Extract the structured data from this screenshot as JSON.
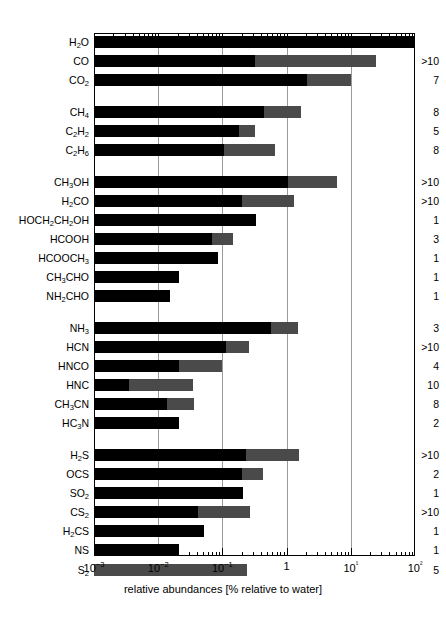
{
  "chart_data": {
    "type": "bar",
    "title": "",
    "xlabel": "relative abundances [% relative to water]",
    "ylabel": "",
    "xscale": "log",
    "xlim": [
      0.001,
      100
    ],
    "xticks": [
      0.001,
      0.01,
      0.1,
      1,
      10,
      100
    ],
    "xticklabels": [
      "10−3",
      "10−2",
      "10−1",
      "1",
      "10¹",
      "10²"
    ],
    "grid": true,
    "legend": null,
    "orientation": "horizontal",
    "series": [
      {
        "name": "lower range",
        "color": "#000000"
      },
      {
        "name": "upper range",
        "color": "#4a4a4a"
      }
    ],
    "annotation_header": "number of comets",
    "groups": [
      {
        "name": "water and oxides",
        "rows": [
          {
            "label": "H2O",
            "label_html": "H<sub>2</sub>O",
            "low": 0.001,
            "mid": 100.0,
            "high": 100.0,
            "comets": ""
          },
          {
            "label": "CO",
            "label_html": "CO",
            "low": 0.001,
            "mid": 0.32,
            "high": 25.0,
            "comets": ">10"
          },
          {
            "label": "CO2",
            "label_html": "CO<sub>2</sub>",
            "low": 0.001,
            "mid": 2.1,
            "high": 10.0,
            "comets": "7"
          }
        ]
      },
      {
        "name": "hydrocarbons",
        "rows": [
          {
            "label": "CH4",
            "label_html": "CH<sub>4</sub>",
            "low": 0.001,
            "mid": 0.45,
            "high": 1.7,
            "comets": "8"
          },
          {
            "label": "C2H2",
            "label_html": "C<sub>2</sub>H<sub>2</sub>",
            "low": 0.001,
            "mid": 0.18,
            "high": 0.32,
            "comets": "5"
          },
          {
            "label": "C2H6",
            "label_html": "C<sub>2</sub>H<sub>6</sub>",
            "low": 0.001,
            "mid": 0.105,
            "high": 0.65,
            "comets": "8"
          }
        ]
      },
      {
        "name": "oxygenated organics",
        "rows": [
          {
            "label": "CH3OH",
            "label_html": "CH<sub>3</sub>OH",
            "low": 0.001,
            "mid": 1.05,
            "high": 6.2,
            "comets": ">10"
          },
          {
            "label": "H2CO",
            "label_html": "H<sub>2</sub>CO",
            "low": 0.001,
            "mid": 0.2,
            "high": 1.3,
            "comets": ">10"
          },
          {
            "label": "HOCH2CH2OH",
            "label_html": "HOCH<sub>2</sub>CH<sub>2</sub>OH",
            "low": 0.001,
            "mid": 0.33,
            "high": 0.33,
            "comets": "1"
          },
          {
            "label": "HCOOH",
            "label_html": "HCOOH",
            "low": 0.001,
            "mid": 0.068,
            "high": 0.145,
            "comets": "3"
          },
          {
            "label": "HCOOCH3",
            "label_html": "HCOOCH<sub>3</sub>",
            "low": 0.001,
            "mid": 0.085,
            "high": 0.085,
            "comets": "1"
          },
          {
            "label": "CH3CHO",
            "label_html": "CH<sub>3</sub>CHO",
            "low": 0.001,
            "mid": 0.021,
            "high": 0.021,
            "comets": "1"
          },
          {
            "label": "NH2CHO",
            "label_html": "NH<sub>2</sub>CHO",
            "low": 0.001,
            "mid": 0.015,
            "high": 0.015,
            "comets": "1"
          }
        ]
      },
      {
        "name": "nitrogen compounds",
        "rows": [
          {
            "label": "NH3",
            "label_html": "NH<sub>3</sub>",
            "low": 0.001,
            "mid": 0.58,
            "high": 1.5,
            "comets": "3"
          },
          {
            "label": "HCN",
            "label_html": "HCN",
            "low": 0.001,
            "mid": 0.115,
            "high": 0.26,
            "comets": ">10"
          },
          {
            "label": "HNCO",
            "label_html": "HNCO",
            "low": 0.001,
            "mid": 0.021,
            "high": 0.1,
            "comets": "4"
          },
          {
            "label": "HNC",
            "label_html": "HNC",
            "low": 0.001,
            "mid": 0.0035,
            "high": 0.035,
            "comets": "10"
          },
          {
            "label": "CH3CN",
            "label_html": "CH<sub>3</sub>CN",
            "low": 0.001,
            "mid": 0.0135,
            "high": 0.036,
            "comets": "8"
          },
          {
            "label": "HC3N",
            "label_html": "HC<sub>3</sub>N",
            "low": 0.001,
            "mid": 0.021,
            "high": 0.021,
            "comets": "2"
          }
        ]
      },
      {
        "name": "sulfur compounds",
        "rows": [
          {
            "label": "H2S",
            "label_html": "H<sub>2</sub>S",
            "low": 0.001,
            "mid": 0.23,
            "high": 1.55,
            "comets": ">10"
          },
          {
            "label": "OCS",
            "label_html": "OCS",
            "low": 0.001,
            "mid": 0.2,
            "high": 0.43,
            "comets": "2"
          },
          {
            "label": "SO2",
            "label_html": "SO<sub>2</sub>",
            "low": 0.001,
            "mid": 0.21,
            "high": 0.21,
            "comets": "1"
          },
          {
            "label": "CS2",
            "label_html": "CS<sub>2</sub>",
            "low": 0.001,
            "mid": 0.042,
            "high": 0.27,
            "comets": ">10"
          },
          {
            "label": "H2CS",
            "label_html": "H<sub>2</sub>CS",
            "low": 0.001,
            "mid": 0.052,
            "high": 0.052,
            "comets": "1"
          },
          {
            "label": "NS",
            "label_html": "NS",
            "low": 0.001,
            "mid": 0.021,
            "high": 0.021,
            "comets": "1"
          },
          {
            "label": "S2",
            "label_html": "S<sub>2</sub>",
            "low": 0.001,
            "mid": 0.001,
            "high": 0.24,
            "comets": "5"
          }
        ]
      }
    ]
  }
}
